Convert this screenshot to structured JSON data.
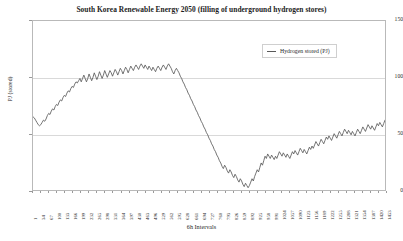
{
  "chart_data": {
    "type": "line",
    "title": "South Korea Renewable Energy 2050 (filling of underground hydrogen stores)",
    "xlabel": "6h Intervals",
    "ylabel": "PJ (stored)",
    "ylim": [
      0,
      150
    ],
    "yticks": [
      0,
      50,
      100,
      150
    ],
    "grid": true,
    "legend_position": "upper-right",
    "legend": [
      "Hydrogen stored (PJ)"
    ],
    "series": [
      {
        "name": "Hydrogen stored (PJ)",
        "color": "#595959",
        "x": [
          1,
          34,
          67,
          100,
          133,
          166,
          199,
          232,
          265,
          298,
          331,
          364,
          397,
          430,
          463,
          496,
          529,
          562,
          595,
          628,
          661,
          694,
          727,
          760,
          793,
          826,
          859,
          892,
          925,
          958,
          991,
          1024,
          1057,
          1090,
          1123,
          1156,
          1189,
          1222,
          1255,
          1288,
          1321,
          1354,
          1387,
          1420,
          1453
        ],
        "values": [
          65,
          62,
          58,
          63,
          70,
          76,
          82,
          88,
          93,
          97,
          95,
          99,
          96,
          101,
          98,
          103,
          100,
          104,
          101,
          106,
          103,
          108,
          105,
          110,
          107,
          112,
          109,
          111,
          106,
          108,
          104,
          106,
          102,
          105,
          100,
          104,
          101,
          106,
          103,
          107,
          104,
          108,
          105,
          109,
          112
        ]
      }
    ],
    "xtick_labels": [
      "1",
      "34",
      "67",
      "100",
      "133",
      "166",
      "199",
      "232",
      "265",
      "298",
      "331",
      "364",
      "397",
      "430",
      "463",
      "496",
      "529",
      "562",
      "595",
      "628",
      "661",
      "694",
      "727",
      "760",
      "793",
      "826",
      "859",
      "892",
      "925",
      "958",
      "991",
      "1024",
      "1057",
      "1090",
      "1123",
      "1156",
      "1189",
      "1222",
      "1255",
      "1288",
      "1321",
      "1354",
      "1387",
      "1420",
      "1453"
    ],
    "dense_values": [
      65,
      64,
      62,
      60,
      58,
      57,
      58,
      60,
      62,
      61,
      63,
      66,
      68,
      67,
      70,
      72,
      71,
      74,
      76,
      75,
      78,
      80,
      79,
      82,
      84,
      83,
      86,
      88,
      87,
      90,
      92,
      91,
      94,
      96,
      95,
      97,
      99,
      96,
      99,
      102,
      99,
      96,
      99,
      103,
      100,
      97,
      100,
      104,
      101,
      98,
      101,
      105,
      102,
      99,
      102,
      106,
      103,
      100,
      103,
      106,
      104,
      101,
      104,
      107,
      105,
      102,
      105,
      108,
      106,
      103,
      106,
      109,
      107,
      104,
      107,
      110,
      108,
      106,
      109,
      111,
      109,
      107,
      110,
      112,
      110,
      108,
      111,
      109,
      107,
      110,
      108,
      106,
      109,
      107,
      105,
      108,
      110,
      108,
      106,
      109,
      111,
      109,
      107,
      110,
      112,
      110,
      108,
      105,
      103,
      106,
      108,
      106,
      104,
      101,
      99,
      96,
      94,
      91,
      89,
      86,
      84,
      81,
      79,
      76,
      74,
      71,
      69,
      66,
      64,
      61,
      59,
      56,
      54,
      51,
      49,
      46,
      44,
      41,
      39,
      36,
      34,
      31,
      29,
      26,
      24,
      21,
      19,
      22,
      20,
      17,
      15,
      18,
      16,
      13,
      11,
      14,
      12,
      9,
      7,
      10,
      8,
      5,
      3,
      6,
      4,
      2,
      4,
      7,
      10,
      8,
      12,
      15,
      18,
      16,
      20,
      24,
      22,
      26,
      30,
      28,
      32,
      30,
      28,
      31,
      29,
      27,
      30,
      28,
      31,
      34,
      32,
      30,
      33,
      31,
      29,
      32,
      30,
      28,
      31,
      34,
      32,
      35,
      33,
      31,
      34,
      37,
      35,
      33,
      36,
      34,
      32,
      35,
      38,
      36,
      39,
      37,
      40,
      43,
      41,
      39,
      42,
      45,
      43,
      41,
      44,
      47,
      45,
      48,
      46,
      44,
      47,
      50,
      48,
      46,
      49,
      52,
      50,
      48,
      51,
      54,
      52,
      50,
      53,
      51,
      49,
      52,
      50,
      48,
      51,
      54,
      52,
      50,
      53,
      56,
      54,
      52,
      55,
      58,
      56,
      54,
      57,
      55,
      53,
      56,
      59,
      57,
      60,
      58,
      56,
      59,
      62
    ]
  }
}
